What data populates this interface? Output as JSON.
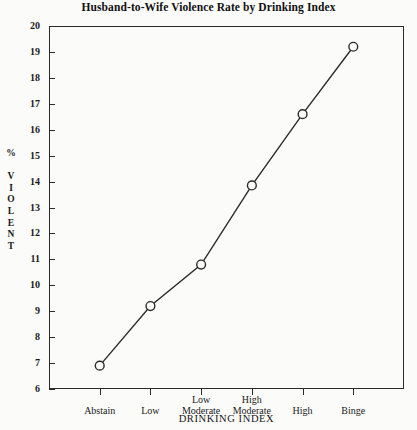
{
  "chart_data": {
    "type": "line",
    "title": "Husband-to-Wife Violence Rate by Drinking Index",
    "xlabel": "DRINKING INDEX",
    "ylabel": "% VIOLENT",
    "categories": [
      "Abstain",
      "Low",
      "Low Moderate",
      "High Moderate",
      "High",
      "Binge"
    ],
    "category_lines": [
      [
        "Abstain"
      ],
      [
        "Low"
      ],
      [
        "Low",
        "Moderate"
      ],
      [
        "High",
        "Moderate"
      ],
      [
        "High"
      ],
      [
        "Binge"
      ]
    ],
    "values": [
      6.9,
      9.2,
      10.8,
      13.85,
      16.6,
      19.2
    ],
    "ylim": [
      6,
      20
    ],
    "yticks": [
      6,
      7,
      8,
      9,
      10,
      11,
      12,
      13,
      14,
      15,
      16,
      17,
      18,
      19,
      20
    ],
    "ytick_labels": [
      "6",
      "7",
      "8",
      "9",
      "10",
      "11",
      "12",
      "13",
      "14",
      "15",
      "16",
      "17",
      "18",
      "19",
      "20"
    ],
    "grid": false,
    "legend": false,
    "marker": "open-circle",
    "line_color": "#2b2b2b",
    "marker_fill": "#fbfbf9",
    "marker_edge": "#2b2b2b",
    "background_color": "#fbfbf9"
  }
}
